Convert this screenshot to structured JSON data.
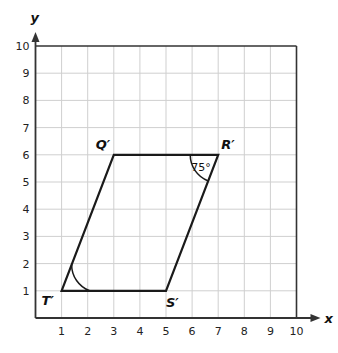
{
  "diagram": {
    "type": "coordinate-plane-parallelogram",
    "axes": {
      "x_label": "x",
      "y_label": "y",
      "x_ticks": [
        "1",
        "2",
        "3",
        "4",
        "5",
        "6",
        "7",
        "8",
        "9",
        "10"
      ],
      "y_ticks": [
        "1",
        "2",
        "3",
        "4",
        "5",
        "6",
        "7",
        "8",
        "9",
        "10"
      ],
      "x_range": [
        0,
        10
      ],
      "y_range": [
        0,
        10
      ]
    },
    "vertices": [
      {
        "name": "Q′",
        "x": 3,
        "y": 6
      },
      {
        "name": "R′",
        "x": 7,
        "y": 6
      },
      {
        "name": "S′",
        "x": 5,
        "y": 1
      },
      {
        "name": "T′",
        "x": 1,
        "y": 1
      }
    ],
    "angle_marks": [
      {
        "vertex": "R′",
        "label": "75°"
      },
      {
        "vertex": "T′",
        "label": ""
      }
    ],
    "colors": {
      "grid": "#cfcfcf",
      "axis": "#333333",
      "shape": "#1a1a1a"
    }
  }
}
